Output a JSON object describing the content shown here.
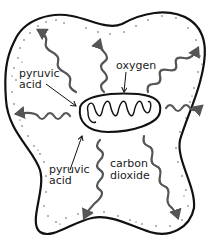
{
  "diagram": {
    "labels": {
      "oxygen": "oxygen",
      "pyruvic_top_line1": "pyruvic",
      "pyruvic_top_line2": "acid",
      "pyruvic_bottom_line1": "pyruvic",
      "pyruvic_bottom_line2": "acid",
      "carbon_line1": "carbon",
      "carbon_line2": "dioxide"
    },
    "colors": {
      "outline": "#111111",
      "arrow": "#555555",
      "stipple": "#333333",
      "background": "#ffffff"
    }
  }
}
